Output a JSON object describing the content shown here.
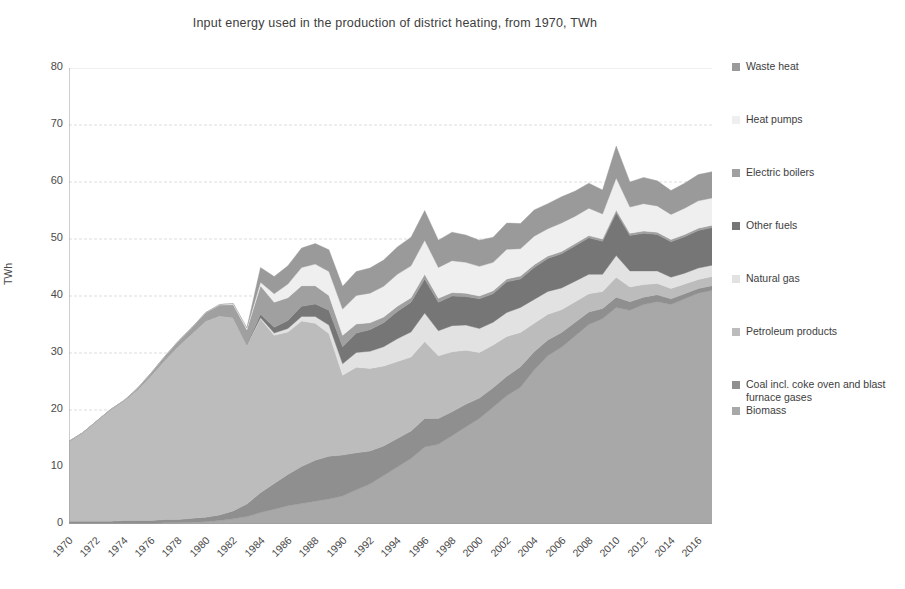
{
  "chart_data": {
    "type": "area",
    "title": "Input energy used in the production of district heating, from 1970, TWh",
    "xlabel": "",
    "ylabel": "TWh",
    "ylim": [
      0,
      80
    ],
    "ytick_step": 10,
    "grid": true,
    "stacked": true,
    "legend_position": "right",
    "ytick_labels": [
      "80",
      "70",
      "60",
      "50",
      "40",
      "30",
      "20",
      "10",
      "0"
    ],
    "xtick_labels": [
      "1970",
      "1972",
      "1974",
      "1976",
      "1978",
      "1980",
      "1982",
      "1984",
      "1986",
      "1988",
      "1990",
      "1992",
      "1994",
      "1996",
      "1998",
      "2000",
      "2002",
      "2004",
      "2006",
      "2008",
      "2010",
      "2012",
      "2014",
      "2016"
    ],
    "x": [
      1970,
      1971,
      1972,
      1973,
      1974,
      1975,
      1976,
      1977,
      1978,
      1979,
      1980,
      1981,
      1982,
      1983,
      1984,
      1985,
      1986,
      1987,
      1988,
      1989,
      1990,
      1991,
      1992,
      1993,
      1994,
      1995,
      1996,
      1997,
      1998,
      1999,
      2000,
      2001,
      2002,
      2003,
      2004,
      2005,
      2006,
      2007,
      2008,
      2009,
      2010,
      2011,
      2012,
      2013,
      2014,
      2015,
      2016,
      2017
    ],
    "series": [
      {
        "name": "Biomass",
        "color": "#a8a8a8",
        "values": [
          0.1,
          0.1,
          0.1,
          0.1,
          0.1,
          0.1,
          0.1,
          0.2,
          0.2,
          0.3,
          0.4,
          0.6,
          0.9,
          1.3,
          2.0,
          2.6,
          3.2,
          3.6,
          4.0,
          4.4,
          4.9,
          6.0,
          7.0,
          8.5,
          10.0,
          11.5,
          13.5,
          14.0,
          15.5,
          17.0,
          18.5,
          20.5,
          22.5,
          24.0,
          27.0,
          29.5,
          31.0,
          33.0,
          35.0,
          36.0,
          38.0,
          37.5,
          38.5,
          39.0,
          38.5,
          39.5,
          40.5,
          41.0
        ]
      },
      {
        "name": "Coal incl. coke oven and blast furnace gases",
        "color": "#8f8f8f",
        "values": [
          0.4,
          0.4,
          0.4,
          0.4,
          0.5,
          0.5,
          0.5,
          0.6,
          0.6,
          0.7,
          0.8,
          1.0,
          1.4,
          2.2,
          3.5,
          4.5,
          5.5,
          6.5,
          7.2,
          7.5,
          7.2,
          6.5,
          5.8,
          5.2,
          5.0,
          4.8,
          5.0,
          4.5,
          4.2,
          4.0,
          3.6,
          3.4,
          3.4,
          3.6,
          3.2,
          2.8,
          2.6,
          2.4,
          2.2,
          1.8,
          1.8,
          1.5,
          1.3,
          1.2,
          1.0,
          0.9,
          0.8,
          0.8
        ]
      },
      {
        "name": "Petroleum products",
        "color": "#bcbcbc",
        "values": [
          14.0,
          15.5,
          17.5,
          19.5,
          21.0,
          23.0,
          25.5,
          28.0,
          30.5,
          32.5,
          34.5,
          35.0,
          34.0,
          28.0,
          30.5,
          26.0,
          25.0,
          25.5,
          24.0,
          21.5,
          14.0,
          15.0,
          14.5,
          14.0,
          13.5,
          13.0,
          13.5,
          11.0,
          10.5,
          9.5,
          8.0,
          7.5,
          7.0,
          6.0,
          5.0,
          4.5,
          4.0,
          3.6,
          3.2,
          3.0,
          3.5,
          2.6,
          2.2,
          2.0,
          1.8,
          1.7,
          1.6,
          1.6
        ]
      },
      {
        "name": "Natural gas",
        "color": "#e2e2e2",
        "values": [
          0.0,
          0.0,
          0.0,
          0.0,
          0.0,
          0.0,
          0.0,
          0.0,
          0.0,
          0.0,
          0.0,
          0.0,
          0.0,
          0.0,
          0.2,
          0.4,
          0.6,
          0.8,
          1.2,
          1.5,
          2.0,
          2.6,
          3.0,
          3.4,
          4.0,
          4.4,
          5.0,
          4.4,
          4.6,
          4.4,
          4.2,
          4.0,
          4.2,
          4.4,
          4.2,
          4.0,
          3.8,
          3.6,
          3.4,
          3.0,
          3.8,
          2.8,
          2.4,
          2.2,
          2.0,
          1.9,
          2.0,
          2.0
        ]
      },
      {
        "name": "Other fuels",
        "color": "#767676",
        "values": [
          0.0,
          0.0,
          0.0,
          0.0,
          0.0,
          0.0,
          0.0,
          0.0,
          0.0,
          0.0,
          0.0,
          0.0,
          0.0,
          0.0,
          0.6,
          1.0,
          1.4,
          1.8,
          2.2,
          2.6,
          3.0,
          3.4,
          3.8,
          4.2,
          4.8,
          5.2,
          6.0,
          5.0,
          5.2,
          5.0,
          5.2,
          5.0,
          5.4,
          5.0,
          5.6,
          5.8,
          6.0,
          6.2,
          6.4,
          5.8,
          7.5,
          6.2,
          6.6,
          6.4,
          6.2,
          6.4,
          6.6,
          6.6
        ]
      },
      {
        "name": "Electric boilers",
        "color": "#a0a0a0",
        "values": [
          0.0,
          0.0,
          0.0,
          0.0,
          0.0,
          0.2,
          0.4,
          0.6,
          0.8,
          1.0,
          1.4,
          1.8,
          2.2,
          2.6,
          5.0,
          4.4,
          4.0,
          3.6,
          3.2,
          2.6,
          2.0,
          1.6,
          1.2,
          1.0,
          0.9,
          0.8,
          0.8,
          0.7,
          0.6,
          0.6,
          0.5,
          0.5,
          0.5,
          0.5,
          0.5,
          0.4,
          0.4,
          0.4,
          0.4,
          0.4,
          0.5,
          0.4,
          0.4,
          0.4,
          0.4,
          0.4,
          0.4,
          0.4
        ]
      },
      {
        "name": "Heat pumps",
        "color": "#efefef",
        "values": [
          0.0,
          0.0,
          0.0,
          0.0,
          0.0,
          0.0,
          0.0,
          0.0,
          0.0,
          0.0,
          0.0,
          0.1,
          0.2,
          0.3,
          0.6,
          1.5,
          2.4,
          3.2,
          3.8,
          4.2,
          4.6,
          5.0,
          5.2,
          5.4,
          5.6,
          5.6,
          6.0,
          5.4,
          5.6,
          5.4,
          5.2,
          5.0,
          5.2,
          4.8,
          5.0,
          4.8,
          5.0,
          4.8,
          4.8,
          4.4,
          5.6,
          4.6,
          4.8,
          4.6,
          4.4,
          4.6,
          4.8,
          4.8
        ]
      },
      {
        "name": "Waste heat",
        "color": "#9a9a9a",
        "values": [
          0.0,
          0.0,
          0.0,
          0.0,
          0.0,
          0.0,
          0.0,
          0.0,
          0.0,
          0.0,
          0.0,
          0.0,
          0.0,
          0.0,
          2.6,
          3.0,
          3.2,
          3.4,
          3.6,
          3.8,
          4.0,
          4.2,
          4.4,
          4.6,
          4.8,
          5.0,
          5.2,
          4.8,
          5.0,
          4.8,
          4.6,
          4.4,
          4.6,
          4.4,
          4.6,
          4.4,
          4.6,
          4.4,
          4.4,
          4.2,
          5.6,
          4.4,
          4.6,
          4.4,
          4.2,
          4.4,
          4.6,
          4.6
        ]
      }
    ],
    "legend_entries": [
      {
        "label": "Waste heat",
        "color": "#9a9a9a"
      },
      {
        "label": "Heat pumps",
        "color": "#efefef"
      },
      {
        "label": "Electric boilers",
        "color": "#a0a0a0"
      },
      {
        "label": "Other fuels",
        "color": "#767676"
      },
      {
        "label": "Natural gas",
        "color": "#e2e2e2"
      },
      {
        "label": "Petroleum products",
        "color": "#bcbcbc"
      },
      {
        "label": "Coal incl. coke oven and blast furnace gases",
        "color": "#8f8f8f"
      },
      {
        "label": "Biomass",
        "color": "#a8a8a8"
      }
    ]
  }
}
